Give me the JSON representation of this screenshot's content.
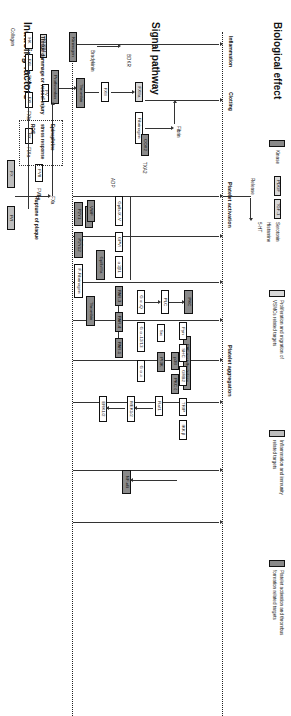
{
  "figure": {
    "type": "biological-pathway-diagram",
    "orientation": "rotated-90-clockwise"
  },
  "sections": {
    "biological_effect": "Biological effect",
    "signal_pathway": "Signal pathway",
    "inducing_factors": "Inducing factors"
  },
  "effects": {
    "inflammation": "Inflammation",
    "clotting": "Clotting",
    "platelet_activation": "Platelet activation",
    "platelet_aggregation": "Platelet aggregation"
  },
  "release": {
    "label": "Release",
    "pdgf": "PDGF",
    "tgf": "TGF-1",
    "serotonin": "Serotonin",
    "histamine": "Histamine",
    "fiveht": "5-HT"
  },
  "inducers": {
    "tissue_damage": "Tissue dammage or vessel injury",
    "epinephrine": "Epinephrine",
    "stress_response": "stress response",
    "ros": "ROS",
    "rupture": "Ruptune of plaque",
    "collagen_left": "Collagen",
    "collagen_mid": "Collagen",
    "collagen_gpvi": "Collagen",
    "thrombin_inducer": "Thrombin",
    "vwf": "VWF",
    "tf": "TF"
  },
  "coagulation": {
    "hk": "HK",
    "fxii": "FXⅡ",
    "fxiia": "FX Ⅱa",
    "fxi": "FXⅠ",
    "fxia": "FXⅠa",
    "fix": "FⅨ",
    "fixa": "FⅨa",
    "fviii": "FⅧ",
    "fviiia": "FⅧa",
    "fvii": "FⅦ",
    "fx": "FⅩ",
    "fxa": "FⅩa",
    "fv": "FⅤ",
    "prothrombin": "Prothrombin",
    "thrombin": "Thrombin",
    "fxiii": "FXⅢ",
    "fxiiia": "FXⅢa",
    "fibrinogen": "Fibrinogen",
    "fibrin": "Fibrin",
    "kallikrein": "KLKB1",
    "bradykinin": "Bradykinin",
    "kininogen": "Kininogen",
    "bdkr": "BDKR"
  },
  "platelet": {
    "cox2": "COX2",
    "txa2": "TXA2",
    "adp": "ADP",
    "p2y1": "P2Y1",
    "p2y12": "P2Y12",
    "f_fibrinogen": "F-Fibrinogen",
    "gp2b3a": "GpⅡb/Ⅲa",
    "gpib": "GpIb-Ⅸ-Ⅴ",
    "gpvi": "GPⅥ",
    "a2b1": "α 2β1",
    "par3": "PAR-3",
    "par4": "PAR-4",
    "par1": "PAR-1",
    "gaq": "G α -Q",
    "ga1213": "G α -12/13",
    "gai": "G α -i",
    "plc": "PLC",
    "pkc": "PKC",
    "src": "Src",
    "fyn": "Fyn",
    "shc": "SHC",
    "grb2": "GRB2",
    "pi3k": "PI3K",
    "p38": "p38",
    "pkcz": "PKC ζ",
    "trip": "TRIP",
    "ikkb": "IKK β",
    "raf1": "Raf1",
    "mek12": "MEK1/2",
    "erk12": "ERK1/2",
    "nfkb": "NF-κB",
    "paf_ah": "PAF acetylhydrolase"
  },
  "legend": {
    "items": [
      {
        "label": "Kinase",
        "color": "#8a8a8a"
      },
      {
        "label": "Proliferation and migration of VSMCs related targets",
        "color": "#d8d8d8"
      },
      {
        "label": "Inflammation and immunity related targets",
        "color": "#bdbdbd"
      },
      {
        "label": "Platelet activation and thrombus formation related targets",
        "color": "#8a8a8a"
      }
    ],
    "kinase": "Kinase",
    "vsmc_1": "Proliferation and migration of",
    "vsmc_2": "VSMCs related targets",
    "inflam_1": "Inflammation and immunity",
    "inflam_2": "related targets",
    "platelet_1": "Platelet activation and thrombus",
    "platelet_2": "formation related targets"
  }
}
